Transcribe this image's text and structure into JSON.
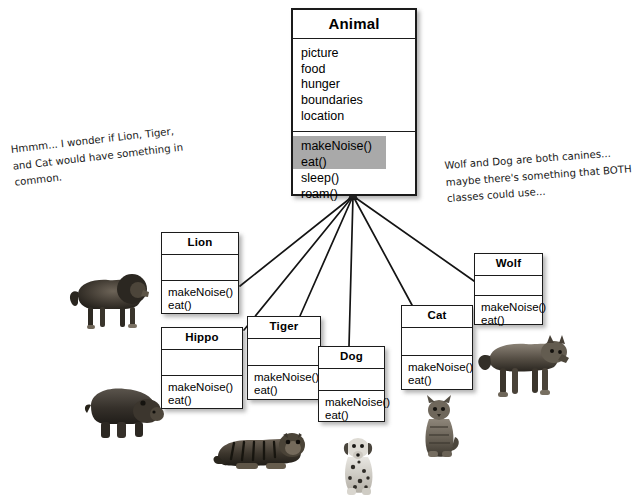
{
  "diagram": {
    "superclass": {
      "name": "Animal",
      "attributes": [
        "picture",
        "food",
        "hunger",
        "boundaries",
        "location"
      ],
      "operations": [
        "makeNoise()",
        "eat()",
        "sleep()",
        "roam()"
      ],
      "highlighted_operations": [
        "makeNoise()",
        "eat()"
      ],
      "highlight_color": "#a9a9a9"
    },
    "subclasses": [
      {
        "name": "Lion",
        "attributes": [],
        "operations": [
          "makeNoise()",
          "eat()"
        ]
      },
      {
        "name": "Hippo",
        "attributes": [],
        "operations": [
          "makeNoise()",
          "eat()"
        ]
      },
      {
        "name": "Tiger",
        "attributes": [],
        "operations": [
          "makeNoise()",
          "eat()"
        ]
      },
      {
        "name": "Dog",
        "attributes": [],
        "operations": [
          "makeNoise()",
          "eat()"
        ]
      },
      {
        "name": "Cat",
        "attributes": [],
        "operations": [
          "makeNoise()",
          "eat()"
        ]
      },
      {
        "name": "Wolf",
        "attributes": [],
        "operations": [
          "makeNoise()",
          "eat()"
        ]
      }
    ],
    "notes": {
      "left": {
        "lines": [
          "Hmmm... I wonder if Lion, Tiger,",
          "and Cat would have something in",
          "common."
        ]
      },
      "right": {
        "lines": [
          "Wolf and Dog are both canines...",
          "maybe there's something that BOTH",
          "classes could use..."
        ]
      }
    },
    "photos": [
      {
        "label": "lion-photo"
      },
      {
        "label": "hippo-photo"
      },
      {
        "label": "tiger-photo"
      },
      {
        "label": "dog-photo"
      },
      {
        "label": "cat-photo"
      },
      {
        "label": "wolf-photo"
      }
    ]
  }
}
